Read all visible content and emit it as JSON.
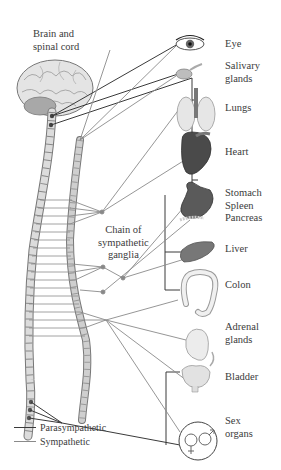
{
  "diagram": {
    "labels": {
      "brain": [
        "Brain and",
        "spinal cord"
      ],
      "ganglia": [
        "Chain of",
        "sympathetic",
        "ganglia"
      ]
    },
    "organs": [
      {
        "id": "eye",
        "label": [
          "Eye"
        ]
      },
      {
        "id": "salivary",
        "label": [
          "Salivary",
          "glands"
        ]
      },
      {
        "id": "lungs",
        "label": [
          "Lungs"
        ]
      },
      {
        "id": "heart",
        "label": [
          "Heart"
        ]
      },
      {
        "id": "stomach",
        "label": [
          "Stomach",
          "Spleen",
          "Pancreas"
        ]
      },
      {
        "id": "liver",
        "label": [
          "Liver"
        ]
      },
      {
        "id": "colon",
        "label": [
          "Colon"
        ]
      },
      {
        "id": "adrenal",
        "label": [
          "Adrenal",
          "glands"
        ]
      },
      {
        "id": "bladder",
        "label": [
          "Bladder"
        ]
      },
      {
        "id": "sex",
        "label": [
          "Sex",
          "organs"
        ]
      }
    ],
    "legend": [
      {
        "label": "Parasympathetic",
        "color": "#3a3a3a"
      },
      {
        "label": "Sympathetic",
        "color": "#8a8a8a"
      }
    ],
    "colors": {
      "parasympathetic": "#3a3a3a",
      "sympathetic": "#8a8a8a",
      "spine_fill": "#d9d9d9",
      "ganglia_fill": "#c8c8c8"
    }
  }
}
